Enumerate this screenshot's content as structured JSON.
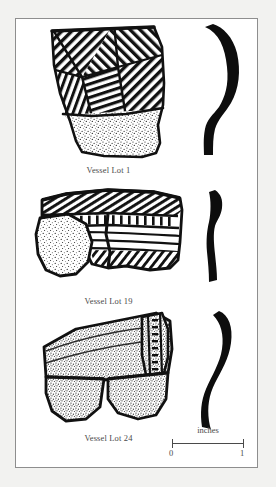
{
  "plate": {
    "background_color": "#f2f2f0",
    "field_color": "#ffffff",
    "frame_color": "#8e8e8e",
    "ink_color": "#111111",
    "text_color": "#4a4a4a"
  },
  "figures": [
    {
      "caption": "Vessel Lot 1",
      "sherd_name": "sherd-drawing-vessel-lot-1",
      "profile_name": "profile-section-vessel-lot-1",
      "decoration": "incised crosshatched diagonal line zones over stippled lower body",
      "profile_shape": "curved everted S-profile"
    },
    {
      "caption": "Vessel Lot 19",
      "sherd_name": "sherd-drawing-vessel-lot-19",
      "profile_name": "profile-section-vessel-lot-19",
      "decoration": "notched rim band with punctate row and horizontal incised lines, detached stippled fragment",
      "profile_shape": "narrow near-vertical profile"
    },
    {
      "caption": "Vessel Lot 24",
      "sherd_name": "sherd-drawing-vessel-lot-24",
      "profile_name": "profile-section-vessel-lot-24",
      "decoration": "stippled surface with vertical applique ridge strip",
      "profile_shape": "sinuous curved profile"
    }
  ],
  "scale": {
    "label": "inches",
    "min": "0",
    "max": "1"
  }
}
